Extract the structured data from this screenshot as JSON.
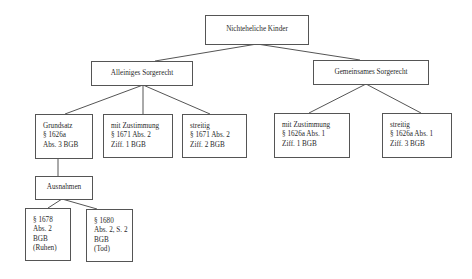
{
  "diagram": {
    "root": {
      "label": "Nichteheliche Kinder"
    },
    "branches": [
      {
        "label": "Alleiniges Sorgerecht",
        "children": [
          {
            "lines": [
              "Grundsatz",
              "§ 1626a",
              "Abs. 3 BGB"
            ]
          },
          {
            "lines": [
              "mit Zustimmung",
              "§ 1671 Abs. 2",
              "Ziff. 1 BGB"
            ]
          },
          {
            "lines": [
              "streitig",
              "§ 1671 Abs. 2",
              "Ziff. 2 BGB"
            ]
          }
        ],
        "exceptions": {
          "label": "Ausnahmen",
          "children": [
            {
              "lines": [
                "§ 1678",
                "Abs. 2",
                "BGB",
                "(Ruhen)"
              ]
            },
            {
              "lines": [
                "§ 1680",
                "Abs. 2, S. 2",
                "BGB",
                "(Tod)"
              ]
            }
          ]
        }
      },
      {
        "label": "Gemeinsames Sorgerecht",
        "children": [
          {
            "lines": [
              "mit Zustimmung",
              "§ 1626a Abs. 1",
              "Ziff. 1 BGB"
            ]
          },
          {
            "lines": [
              "streitig",
              "§ 1626a Abs. 1",
              "Ziff. 3 BGB"
            ]
          }
        ]
      }
    ]
  }
}
